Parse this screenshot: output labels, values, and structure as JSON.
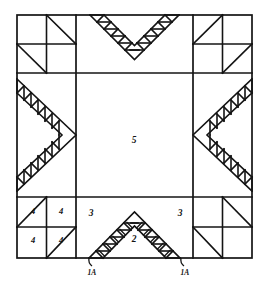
{
  "diagram": {
    "type": "quilt-block-pattern",
    "colors": {
      "line": "#141414",
      "background": "#ffffff",
      "label": "#141414"
    },
    "frame": {
      "x": 17,
      "y": 15,
      "width": 235,
      "height": 243
    },
    "grid": {
      "columns": [
        17,
        76,
        193,
        252
      ],
      "rows": [
        15,
        73,
        197,
        258
      ]
    },
    "labels": {
      "center": "5",
      "bottom_left_inner": "3",
      "bottom_right_inner": "3",
      "bottom_center": "2",
      "corner_tl_a": "4",
      "corner_tl_b": "4",
      "corner_tl_c": "4",
      "corner_tl_d": "4",
      "callout_left": "1A",
      "callout_right": "1A"
    },
    "piece_labels": [
      {
        "name": "center-square-label",
        "text": "5",
        "x": 134,
        "y": 143
      },
      {
        "name": "bottom-left-triangle-label",
        "text": "3",
        "x": 91,
        "y": 216
      },
      {
        "name": "bottom-right-triangle-label",
        "text": "3",
        "x": 180,
        "y": 216
      },
      {
        "name": "bottom-center-triangle-label",
        "text": "2",
        "x": 134,
        "y": 242
      },
      {
        "name": "corner-patch-label-1",
        "text": "4",
        "x": 33,
        "y": 214
      },
      {
        "name": "corner-patch-label-2",
        "text": "4",
        "x": 61,
        "y": 214
      },
      {
        "name": "corner-patch-label-3",
        "text": "4",
        "x": 33,
        "y": 243
      },
      {
        "name": "corner-patch-label-4",
        "text": "4",
        "x": 61,
        "y": 243
      }
    ],
    "callouts": [
      {
        "name": "callout-1a-left",
        "text": "1A",
        "x": 91,
        "y": 274,
        "line_x1": 89,
        "line_y1": 258,
        "line_x2": 92,
        "line_y2": 266
      },
      {
        "name": "callout-1a-right",
        "text": "1A",
        "x": 184,
        "y": 274,
        "line_x1": 182,
        "line_y1": 258,
        "line_x2": 185,
        "line_y2": 266
      }
    ],
    "sections": {
      "top_band": "sawtooth-chevron-pointing-down",
      "bottom_band": "sawtooth-chevron-pointing-up-with-cross-marks",
      "left_band": "sawtooth-chevron-pointing-right",
      "right_band": "sawtooth-chevron-pointing-left",
      "corners": "four-patch-half-square-triangles",
      "center": "plain-square"
    }
  }
}
